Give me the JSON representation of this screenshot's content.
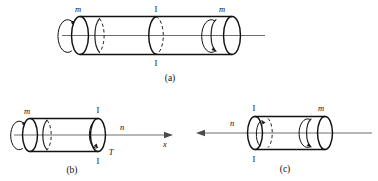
{
  "figure": {
    "background_color": "#ffffff",
    "line_color": "#111111",
    "axis_color": "#6e6e6e",
    "panels": [
      {
        "id": "a",
        "caption": "(a)",
        "labels": {
          "left_torque": "m",
          "right_torque": "m",
          "section_top": "I",
          "section_bottom": "I"
        }
      },
      {
        "id": "b",
        "caption": "(b)",
        "labels": {
          "left_torque": "m",
          "section_top": "I",
          "section_bottom": "I",
          "internal_torque": "T",
          "normal_label": "n",
          "axis_label": "x"
        }
      },
      {
        "id": "c",
        "caption": "(c)",
        "labels": {
          "right_torque": "m",
          "section_top": "I",
          "section_bottom": "I",
          "normal_label": "n"
        }
      }
    ]
  }
}
